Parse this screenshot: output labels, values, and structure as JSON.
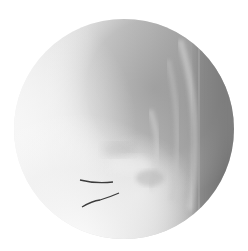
{
  "image": {
    "kind": "circular radiograph (fluoroscopy view)",
    "background_color": "#ffffff",
    "field_of_view": {
      "cx": 124,
      "cy": 129,
      "r": 110
    },
    "colors": {
      "light_region": "#e9e9e9",
      "mid_gray": "#b4b4b4",
      "dark_edge": "#6f6f6f",
      "marker_lines": "#3c3c3c"
    },
    "annotations": [
      {
        "type": "marker-line",
        "label": "upper-marker"
      },
      {
        "type": "marker-line",
        "label": "lower-marker"
      }
    ]
  }
}
